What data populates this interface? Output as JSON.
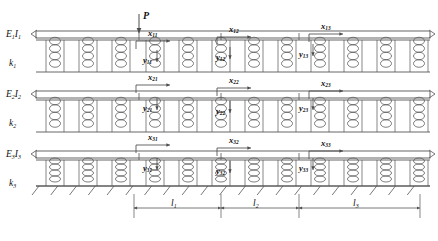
{
  "figure": {
    "type": "mechanical-schematic",
    "width": 438,
    "height": 241,
    "line_color": "#4d4d4d",
    "text_color": "#111111",
    "background": "#ffffff"
  },
  "load": {
    "symbol": "P",
    "x": 139,
    "y": 10,
    "arrow_from_y": 14,
    "arrow_to_y": 33
  },
  "beams": [
    {
      "id": "beam1",
      "label": "E",
      "sub": "1",
      "label2": "I",
      "sub2": "1",
      "y": 33,
      "lx": 6,
      "ly": 29
    },
    {
      "id": "beam2",
      "label": "E",
      "sub": "2",
      "label2": "I",
      "sub2": "2",
      "y": 93,
      "lx": 6,
      "ly": 89
    },
    {
      "id": "beam3",
      "label": "E",
      "sub": "3",
      "label2": "I",
      "sub2": "3",
      "y": 153,
      "lx": 6,
      "ly": 149
    }
  ],
  "foundations": [
    {
      "id": "k1",
      "label": "k",
      "sub": "1",
      "lx": 9,
      "ly": 58
    },
    {
      "id": "k2",
      "label": "k",
      "sub": "2",
      "lx": 9,
      "ly": 118
    },
    {
      "id": "k3",
      "label": "k",
      "sub": "3",
      "lx": 9,
      "ly": 178
    }
  ],
  "displacements": {
    "horizontal": [
      {
        "name": "x",
        "sub": "11",
        "lx": 148,
        "ly": 28
      },
      {
        "name": "x",
        "sub": "12",
        "lx": 229,
        "ly": 24
      },
      {
        "name": "x",
        "sub": "13",
        "lx": 321,
        "ly": 21
      },
      {
        "name": "x",
        "sub": "21",
        "lx": 148,
        "ly": 72
      },
      {
        "name": "x",
        "sub": "22",
        "lx": 229,
        "ly": 75
      },
      {
        "name": "x",
        "sub": "23",
        "lx": 321,
        "ly": 78
      },
      {
        "name": "x",
        "sub": "31",
        "lx": 148,
        "ly": 132
      },
      {
        "name": "x",
        "sub": "32",
        "lx": 229,
        "ly": 135
      },
      {
        "name": "x",
        "sub": "33",
        "lx": 321,
        "ly": 138
      }
    ],
    "vertical": [
      {
        "name": "y",
        "sub": "11",
        "lx": 143,
        "ly": 55
      },
      {
        "name": "y",
        "sub": "12",
        "lx": 216,
        "ly": 52
      },
      {
        "name": "y",
        "sub": "13",
        "lx": 299,
        "ly": 49
      },
      {
        "name": "y",
        "sub": "21",
        "lx": 143,
        "ly": 103
      },
      {
        "name": "y",
        "sub": "22",
        "lx": 216,
        "ly": 106
      },
      {
        "name": "y",
        "sub": "23",
        "lx": 299,
        "ly": 103
      },
      {
        "name": "y",
        "sub": "31",
        "lx": 143,
        "ly": 163
      },
      {
        "name": "y",
        "sub": "32",
        "lx": 216,
        "ly": 166
      },
      {
        "name": "y",
        "sub": "33",
        "lx": 299,
        "ly": 163
      }
    ]
  },
  "dimensions": [
    {
      "name": "l",
      "sub": "1",
      "x1": 134,
      "x2": 221,
      "lx": 171,
      "ly": 198
    },
    {
      "name": "l",
      "sub": "2",
      "x1": 221,
      "x2": 299,
      "lx": 253,
      "ly": 198
    },
    {
      "name": "l",
      "sub": "3",
      "x1": 299,
      "x2": 420,
      "lx": 353,
      "ly": 198
    }
  ],
  "ground": {
    "y": 186,
    "x_start": 36,
    "x_end": 430,
    "hatch_count": 21
  },
  "springs": {
    "rows": [
      {
        "row": 1,
        "y_top": 40,
        "y_bottom": 72,
        "x_positions": [
          55,
          88,
          121,
          155,
          188,
          221,
          254,
          287,
          320,
          353,
          386,
          419
        ]
      },
      {
        "row": 2,
        "y_top": 100,
        "y_bottom": 132,
        "x_positions": [
          55,
          88,
          121,
          155,
          188,
          221,
          254,
          287,
          320,
          353,
          386,
          419
        ]
      },
      {
        "row": 3,
        "y_top": 160,
        "y_bottom": 186,
        "x_positions": [
          55,
          88,
          121,
          155,
          188,
          221,
          254,
          287,
          320,
          353,
          386,
          419
        ]
      }
    ],
    "coil_count": 4,
    "coil_width": 11
  }
}
